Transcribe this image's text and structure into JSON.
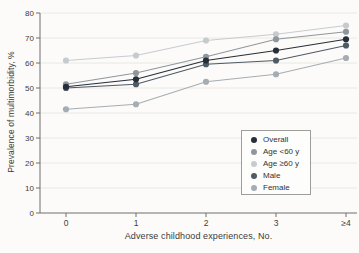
{
  "chart_data": {
    "type": "line",
    "title": "",
    "xlabel": "Adverse childhood experiences, No.",
    "ylabel": "Prevalence of multimorbidity, %",
    "categories": [
      "0",
      "1",
      "2",
      "3",
      "≥4"
    ],
    "ylim": [
      0,
      80
    ],
    "yticks": [
      0,
      10,
      20,
      30,
      40,
      50,
      60,
      70,
      80
    ],
    "grid": "horizontal",
    "legend_position": "lower-right-box",
    "series": [
      {
        "name": "Overall",
        "color": "#262f39",
        "values": [
          50.5,
          53.5,
          61,
          65,
          69.5
        ]
      },
      {
        "name": "Age <60 y",
        "color": "#8f979d",
        "values": [
          51.5,
          56,
          62.5,
          69.5,
          72.5
        ]
      },
      {
        "name": "Age ≥60 y",
        "color": "#c6ccce",
        "values": [
          61,
          63,
          69,
          71.5,
          75
        ]
      },
      {
        "name": "Male",
        "color": "#4e5a64",
        "values": [
          50,
          51.5,
          59.5,
          61,
          67
        ]
      },
      {
        "name": "Female",
        "color": "#a6adb2",
        "values": [
          41.5,
          43.5,
          52.5,
          55.5,
          62
        ]
      }
    ],
    "draw_order": [
      2,
      4,
      1,
      3,
      0
    ]
  },
  "style": {
    "axis_color": "#6f6f6c",
    "grid_color": "#e9e8e4",
    "tick_label_color": "#3c3c3a"
  }
}
